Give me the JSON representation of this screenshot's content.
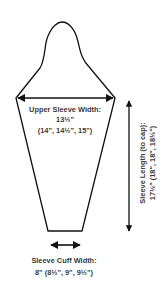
{
  "diagram": {
    "type": "sleeve-schematic",
    "line_color": "#111111",
    "text_color": "#3a3a3a",
    "upper_width": {
      "label": "Upper Sleeve Width:",
      "value": "13½\"",
      "sizes": "(14\", 14½\", 15\")"
    },
    "sleeve_length": {
      "label": "Sleeve Length (to cap):",
      "values": "17½\" (18\", 18\", 18½\")"
    },
    "cuff_width": {
      "label": "Sleeve Cuff Width:",
      "values": "8\" (8½\", 9\", 9½\")"
    }
  }
}
